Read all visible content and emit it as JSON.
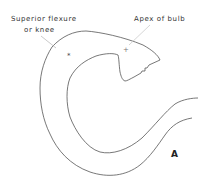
{
  "diagram": {
    "labels": {
      "superior_line1": "Superior flexure",
      "superior_line2": "or knee",
      "apex": "Apex of bulb",
      "panel": "A"
    },
    "colors": {
      "stroke": "#555555",
      "leader": "#bbbbbb",
      "text": "#333333"
    }
  }
}
